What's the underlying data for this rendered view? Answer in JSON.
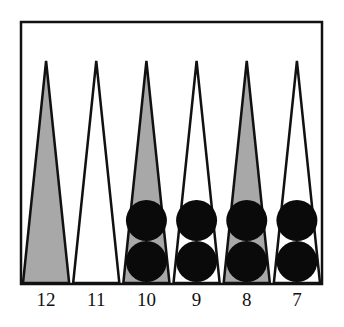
{
  "diagram": {
    "colors": {
      "background": "#ffffff",
      "board_border": "#111111",
      "shaded_point": "#a8a8a8",
      "plain_point": "#ffffff",
      "checker": "#0a0a0a"
    },
    "points": [
      {
        "number": "12",
        "shaded": true,
        "checkers": 0
      },
      {
        "number": "11",
        "shaded": false,
        "checkers": 0
      },
      {
        "number": "10",
        "shaded": true,
        "checkers": 2
      },
      {
        "number": "9",
        "shaded": false,
        "checkers": 2
      },
      {
        "number": "8",
        "shaded": true,
        "checkers": 2
      },
      {
        "number": "7",
        "shaded": false,
        "checkers": 2
      }
    ]
  }
}
